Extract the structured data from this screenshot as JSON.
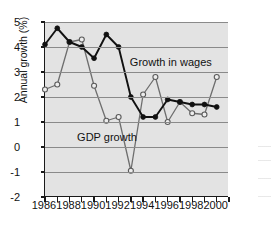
{
  "chart_data": {
    "type": "line",
    "title": "",
    "xlabel": "",
    "ylabel": "Annual growth (%)",
    "xlim": [
      1986,
      2001
    ],
    "ylim": [
      -2,
      5
    ],
    "yticks": [
      -2,
      -1,
      0,
      1,
      2,
      3,
      4,
      5
    ],
    "ytick_labels": [
      "-2",
      "-1",
      "0",
      "1",
      "2",
      "3",
      "4",
      "5"
    ],
    "xticks": [
      1986,
      1987,
      1988,
      1989,
      1990,
      1991,
      1992,
      1993,
      1994,
      1995,
      1996,
      1997,
      1998,
      1999,
      2000,
      2001
    ],
    "xtick_labels_shown": [
      "1986",
      "1988",
      "1990",
      "1992",
      "1994",
      "1996",
      "1998",
      "2000"
    ],
    "grid": "horizontal",
    "legend_position": "inline-annotations",
    "x": [
      1986,
      1987,
      1988,
      1989,
      1990,
      1991,
      1992,
      1993,
      1994,
      1995,
      1996,
      1997,
      1998,
      1999,
      2000
    ],
    "series": [
      {
        "name": "Growth in wages",
        "color": "#111111",
        "marker": "filled-circle",
        "values": [
          4.1,
          4.75,
          4.2,
          4.0,
          3.55,
          4.5,
          4.0,
          2.0,
          1.2,
          1.2,
          1.9,
          1.8,
          1.7,
          1.7,
          1.6
        ]
      },
      {
        "name": "GDP growth",
        "color": "#6e6e6e",
        "marker": "open-circle",
        "values": [
          2.3,
          2.5,
          4.2,
          4.3,
          2.45,
          1.05,
          1.2,
          -0.95,
          2.1,
          2.8,
          1.0,
          1.8,
          1.35,
          1.3,
          2.8
        ]
      }
    ],
    "annotations": [
      {
        "text": "Growth in wages",
        "x": 1993.0,
        "y": 3.35
      },
      {
        "text": "GDP growth",
        "x": 1988.7,
        "y": 0.35
      }
    ],
    "colors": {
      "plot_background": "#e3e3e3",
      "gridline": "#8a8a8a",
      "axis": "#1a1a1a",
      "wages_series": "#111111",
      "gdp_series": "#6e6e6e",
      "page_background": "#ffffff"
    }
  }
}
